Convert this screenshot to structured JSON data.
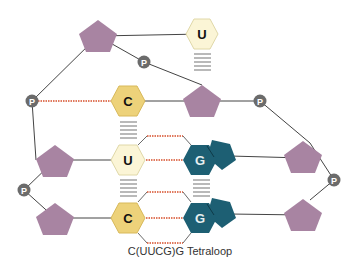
{
  "caption": "C(UUCG)G Tetraloop",
  "colors": {
    "sugar": "#a884a2",
    "phosphate": "#6b6b6b",
    "cytosine": "#edd27a",
    "uracil": "#fbf5d6",
    "guanine": "#1d5f73",
    "backbone": "#444444",
    "hbond": "#e07a5f",
    "stack": "#8a8a8a"
  },
  "labels": {
    "phosphate": "P",
    "cytosine": "C",
    "uracil": "U",
    "guanine": "G"
  },
  "nucleotides": [
    {
      "id": "U-top",
      "base": "U",
      "row": 1
    },
    {
      "id": "C-row2",
      "base": "C",
      "row": 2
    },
    {
      "id": "U-row3",
      "base": "U",
      "row": 3
    },
    {
      "id": "G-row3",
      "base": "G",
      "row": 3
    },
    {
      "id": "C-row4",
      "base": "C",
      "row": 4
    },
    {
      "id": "G-row4",
      "base": "G",
      "row": 4
    }
  ],
  "phosphate_count": 6,
  "sugar_count": 6
}
